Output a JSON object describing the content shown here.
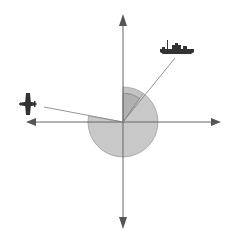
{
  "diagram": {
    "type": "bearing-sector-diagram",
    "center": [
      123,
      122
    ],
    "axes": {
      "horizontal": {
        "from": [
          26,
          122
        ],
        "to": [
          221,
          122
        ]
      },
      "vertical": {
        "from": [
          123,
          15
        ],
        "to": [
          123,
          228
        ]
      }
    },
    "sector": {
      "radius": 35,
      "start_angle_deg": 55,
      "end_angle_deg": 170,
      "fill": "#c8c8c8",
      "stroke": "#9a9a9a"
    },
    "inner_sector": {
      "radius": 29,
      "start_angle_deg": 90,
      "end_angle_deg": 55,
      "fill": "#b0b0b0",
      "rim": "#8a8a8a"
    },
    "lines": {
      "ship_line": {
        "to": [
          175,
          58
        ]
      },
      "plane_line": {
        "to": [
          44,
          107
        ]
      }
    },
    "icons": {
      "ship": "ship-icon",
      "plane": "airplane-icon"
    },
    "colors": {
      "axis": "#555555",
      "line": "#777777",
      "icon": "#333333"
    }
  }
}
